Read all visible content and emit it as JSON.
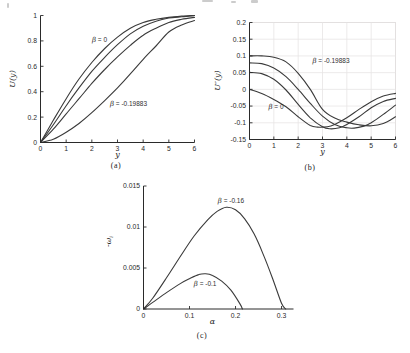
{
  "figure": {
    "width": 410,
    "height": 353,
    "background": "#ffffff",
    "curve_color": "#3a3a3a",
    "axis_color": "#2a2a2a",
    "grid_color": "#e7e4e4",
    "text_color": "#2a2a2a"
  },
  "captions": {
    "a": "(a)",
    "b": "(b)",
    "c": "(c)"
  },
  "chart_data": [
    {
      "id": "a",
      "type": "line",
      "title": "",
      "xlabel": "y",
      "ylabel": "U(y)",
      "xlim": [
        0,
        6
      ],
      "ylim": [
        0,
        1
      ],
      "grid": false,
      "legend": "none (inline annotations)",
      "xticks": {
        "values": [
          0,
          1,
          2,
          3,
          4,
          5,
          6
        ],
        "labels": [
          "0",
          "1",
          "2",
          "3",
          "4",
          "5",
          "6"
        ]
      },
      "yticks": {
        "values": [
          0,
          0.2,
          0.4,
          0.6,
          0.8,
          1
        ],
        "labels": [
          "0",
          "0.2",
          "0.4",
          "0.6",
          "0.8",
          "1"
        ]
      },
      "series": [
        {
          "label": "β = 0",
          "x": [
            0,
            0.5,
            1,
            1.5,
            2,
            2.5,
            3,
            3.5,
            4,
            4.5,
            5,
            5.5,
            6
          ],
          "y": [
            0,
            0.175,
            0.345,
            0.5,
            0.63,
            0.74,
            0.83,
            0.9,
            0.945,
            0.97,
            0.985,
            0.995,
            1.0
          ]
        },
        {
          "label": "",
          "x": [
            0,
            0.5,
            1,
            1.5,
            2,
            2.5,
            3,
            3.5,
            4,
            4.5,
            5,
            5.5,
            6
          ],
          "y": [
            0,
            0.14,
            0.29,
            0.43,
            0.56,
            0.67,
            0.77,
            0.855,
            0.915,
            0.955,
            0.98,
            0.99,
            1.0
          ]
        },
        {
          "label": "",
          "x": [
            0,
            0.5,
            1,
            1.5,
            2,
            2.5,
            3,
            3.5,
            4,
            4.5,
            5,
            5.5,
            6
          ],
          "y": [
            0,
            0.105,
            0.225,
            0.345,
            0.465,
            0.575,
            0.675,
            0.765,
            0.845,
            0.9,
            0.945,
            0.97,
            0.985
          ]
        },
        {
          "label": "β = -0.19883",
          "x": [
            0,
            0.5,
            1,
            1.5,
            2,
            2.5,
            3,
            3.5,
            4,
            4.5,
            5,
            5.5,
            6
          ],
          "y": [
            0,
            0.025,
            0.08,
            0.15,
            0.235,
            0.33,
            0.43,
            0.54,
            0.655,
            0.76,
            0.87,
            0.925,
            0.96
          ]
        }
      ],
      "annotations": [
        {
          "text": "β = 0",
          "x": 2.3,
          "y": 0.81
        },
        {
          "text": "β = -0.19883",
          "x": 3.43,
          "y": 0.305
        }
      ]
    },
    {
      "id": "b",
      "type": "line",
      "title": "",
      "xlabel": "y",
      "ylabel": "U″(y)",
      "xlim": [
        0,
        6
      ],
      "ylim": [
        -0.15,
        0.2
      ],
      "grid": true,
      "legend": "none (inline annotations)",
      "xticks": {
        "values": [
          0,
          1,
          2,
          3,
          4,
          5,
          6
        ],
        "labels": [
          "0",
          "1",
          "2",
          "3",
          "4",
          "5",
          "6"
        ]
      },
      "yticks": {
        "values": [
          -0.15,
          -0.1,
          -0.05,
          0,
          0.05,
          0.1,
          0.15,
          0.2
        ],
        "labels": [
          "-0.15",
          "-0.1",
          "-0.05",
          "0",
          "0.05",
          "0.1",
          "0.15",
          "0.2"
        ]
      },
      "series": [
        {
          "label": "β = 0",
          "x": [
            0,
            0.5,
            1,
            1.5,
            2,
            2.5,
            2.8,
            3.2,
            3.5,
            4,
            4.5,
            5,
            5.5,
            6
          ],
          "y": [
            0,
            -0.012,
            -0.03,
            -0.052,
            -0.082,
            -0.108,
            -0.113,
            -0.112,
            -0.105,
            -0.085,
            -0.06,
            -0.037,
            -0.02,
            -0.012
          ]
        },
        {
          "label": "",
          "x": [
            0,
            0.5,
            1,
            1.5,
            2,
            2.5,
            3,
            3.3,
            3.7,
            4,
            4.5,
            5,
            5.5,
            6
          ],
          "y": [
            0.051,
            0.047,
            0.03,
            -0.002,
            -0.045,
            -0.085,
            -0.112,
            -0.118,
            -0.115,
            -0.105,
            -0.082,
            -0.055,
            -0.036,
            -0.027
          ]
        },
        {
          "label": "",
          "x": [
            0,
            0.5,
            1,
            1.5,
            2,
            2.5,
            3,
            3.5,
            4,
            4.3,
            4.7,
            5,
            5.5,
            6
          ],
          "y": [
            0.079,
            0.077,
            0.064,
            0.038,
            0.0,
            -0.042,
            -0.08,
            -0.105,
            -0.115,
            -0.116,
            -0.11,
            -0.1,
            -0.075,
            -0.047
          ]
        },
        {
          "label": "β = -0.19883",
          "x": [
            0,
            0.5,
            1,
            1.5,
            2,
            2.5,
            3,
            3.5,
            4,
            4.5,
            5,
            5.5,
            6
          ],
          "y": [
            0.1,
            0.1,
            0.096,
            0.082,
            0.048,
            0.0,
            -0.06,
            -0.086,
            -0.098,
            -0.106,
            -0.109,
            -0.102,
            -0.082
          ]
        }
      ],
      "annotations": [
        {
          "text": "β = -0.19883",
          "x": 3.35,
          "y": 0.086
        },
        {
          "text": "β = 0",
          "x": 1.09,
          "y": -0.054
        }
      ]
    },
    {
      "id": "c",
      "type": "line",
      "title": "",
      "xlabel": "α",
      "ylabel": "-ω_i",
      "xlim": [
        0,
        0.326
      ],
      "ylim": [
        0,
        0.015
      ],
      "grid": false,
      "legend": "none (inline annotations)",
      "xticks": {
        "values": [
          0,
          0.1,
          0.2,
          0.3
        ],
        "labels": [
          "0",
          "0.1",
          "0.2",
          "0.3"
        ]
      },
      "yticks": {
        "values": [
          0,
          0.005,
          0.01,
          0.015
        ],
        "labels": [
          "0",
          "0.005",
          "0.01",
          "0.015"
        ]
      },
      "series": [
        {
          "label": "β = -0.16",
          "x": [
            0,
            0.02,
            0.05,
            0.08,
            0.11,
            0.14,
            0.16,
            0.18,
            0.2,
            0.22,
            0.24,
            0.26,
            0.28,
            0.3,
            0.309
          ],
          "y": [
            0,
            0.0013,
            0.0038,
            0.0064,
            0.0089,
            0.0109,
            0.0119,
            0.0124,
            0.0121,
            0.011,
            0.0092,
            0.0067,
            0.0038,
            0.0007,
            0
          ]
        },
        {
          "label": "β = -0.1",
          "x": [
            0,
            0.02,
            0.05,
            0.08,
            0.1,
            0.12,
            0.135,
            0.15,
            0.17,
            0.19,
            0.21,
            0.215
          ],
          "y": [
            0,
            0.0008,
            0.002,
            0.0031,
            0.0037,
            0.0042,
            0.0043,
            0.0041,
            0.0034,
            0.0023,
            0.0006,
            0
          ]
        }
      ],
      "annotations": [
        {
          "text": "β = -0.16",
          "x": 0.19,
          "y": 0.0132
        },
        {
          "text": "β = -0.1",
          "x": 0.134,
          "y": 0.0031
        }
      ]
    }
  ]
}
